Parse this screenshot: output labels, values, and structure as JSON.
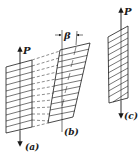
{
  "figure": {
    "panels": [
      {
        "id": "a",
        "label": "(a)",
        "force_label": "P",
        "description": "Unsheared block with horizontal layers, axial force P"
      },
      {
        "id": "b",
        "label": "(b)",
        "angle_label": "β",
        "description": "Sheared block, layers slid by angle β"
      },
      {
        "id": "c",
        "label": "(c)",
        "force_label": "P",
        "description": "Block with inclined layers, axial force P"
      }
    ],
    "colors": {
      "stroke": "#1a1a1a",
      "background": "#ffffff"
    }
  }
}
